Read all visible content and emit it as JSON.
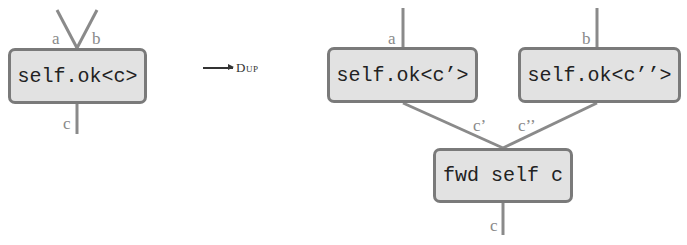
{
  "diagram": {
    "left": {
      "box": {
        "label": "self.ok<c>"
      },
      "inputs": [
        "a",
        "b"
      ],
      "output": "c"
    },
    "arrow": {
      "rule": "Dup"
    },
    "right": {
      "boxes": [
        {
          "label": "self.ok<c’>",
          "input": "a",
          "output": "c’"
        },
        {
          "label": "self.ok<c’’>",
          "input": "b",
          "output": "c’’"
        },
        {
          "label": "fwd self c",
          "output": "c"
        }
      ]
    },
    "colors": {
      "box_fill": "#e2e2e2",
      "box_border": "#7a7a7a",
      "wire": "#8a8a8a",
      "label": "#8a8a8a"
    }
  }
}
